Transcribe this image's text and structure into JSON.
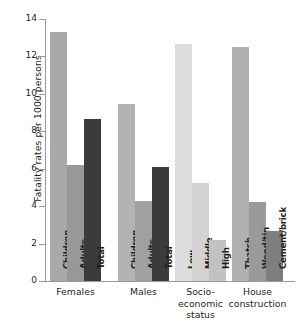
{
  "chart_data": {
    "type": "bar",
    "title": "",
    "xlabel": "",
    "ylabel": "Fatality rates per 1000 persons",
    "ylim": [
      0,
      14
    ],
    "yticks": [
      0,
      2,
      4,
      6,
      8,
      10,
      12,
      14
    ],
    "ytick_labels": [
      "0",
      "2",
      "4",
      "6",
      "8",
      "10",
      "12",
      "14"
    ],
    "grid": false,
    "legend": "none",
    "groups": [
      {
        "name": "Females",
        "label_lines": [
          "Females"
        ],
        "bars": [
          {
            "label": "Children",
            "value": 13.3,
            "color": "#a9a9a9"
          },
          {
            "label": "Adults",
            "value": 6.2,
            "color": "#989898"
          },
          {
            "label": "Total",
            "value": 8.65,
            "color": "#3b3b3b"
          }
        ]
      },
      {
        "name": "Males",
        "label_lines": [
          "Males"
        ],
        "bars": [
          {
            "label": "Children",
            "value": 9.45,
            "color": "#b3b3b3"
          },
          {
            "label": "Adults",
            "value": 4.25,
            "color": "#a0a0a0"
          },
          {
            "label": "Total",
            "value": 6.1,
            "color": "#3b3b3b"
          }
        ]
      },
      {
        "name": "Socio-economic status",
        "label_lines": [
          "Socio-",
          "economic",
          "status"
        ],
        "bars": [
          {
            "label": "Low",
            "value": 12.65,
            "color": "#dcdcdc"
          },
          {
            "label": "Middle",
            "value": 5.25,
            "color": "#d2d2d2"
          },
          {
            "label": "High",
            "value": 2.2,
            "color": "#c2c2c2"
          }
        ]
      },
      {
        "name": "House construction",
        "label_lines": [
          "House",
          "construction"
        ],
        "bars": [
          {
            "label": "Thatch",
            "value": 12.5,
            "color": "#b0b0b0"
          },
          {
            "label": "Wood/tin",
            "value": 4.2,
            "color": "#9a9a9a"
          },
          {
            "label": "Cement/brick",
            "value": 2.65,
            "color": "#7e7e7e"
          }
        ]
      }
    ]
  },
  "axis": {
    "color": "#9a9a9a"
  }
}
